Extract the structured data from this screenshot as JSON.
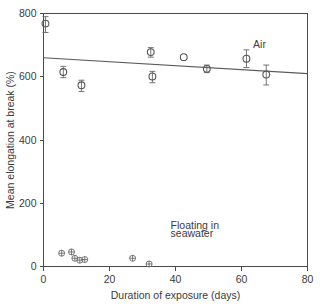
{
  "chart_data": {
    "type": "scatter",
    "title": "",
    "xlabel": "Duration of exposure (days)",
    "ylabel": "Mean elongation at break (%)",
    "xlim": [
      0,
      80
    ],
    "ylim": [
      0,
      800
    ],
    "xticks": [
      0,
      20,
      40,
      60,
      80
    ],
    "yticks": [
      0,
      200,
      400,
      600,
      800
    ],
    "xtick_labels": [
      "0",
      "20",
      "40",
      "60",
      "80"
    ],
    "ytick_labels": [
      "0",
      "200",
      "400",
      "600",
      "800"
    ],
    "grid": false,
    "legend_position": "inline-annotations",
    "annotations": [
      {
        "id": "air",
        "text": "Air",
        "x": 63.5,
        "y": 690
      },
      {
        "id": "seawater-line1",
        "text": "Floating in",
        "x": 38.5,
        "y": 120
      },
      {
        "id": "seawater-line2",
        "text": "seawater",
        "x": 38.5,
        "y": 92
      }
    ],
    "series": [
      {
        "name": "Air",
        "marker": "open-circle",
        "has_error_bars": true,
        "points": [
          {
            "x": 0.6,
            "y": 768,
            "yerr_low": 28,
            "yerr_high": 22
          },
          {
            "x": 6.0,
            "y": 615,
            "yerr_low": 18,
            "yerr_high": 18
          },
          {
            "x": 11.5,
            "y": 573,
            "yerr_low": 20,
            "yerr_high": 16
          },
          {
            "x": 32.5,
            "y": 678,
            "yerr_low": 16,
            "yerr_high": 14
          },
          {
            "x": 33.0,
            "y": 601,
            "yerr_low": 20,
            "yerr_high": 16
          },
          {
            "x": 42.5,
            "y": 662,
            "yerr_low": 0,
            "yerr_high": 0
          },
          {
            "x": 49.5,
            "y": 625,
            "yerr_low": 12,
            "yerr_high": 12
          },
          {
            "x": 61.5,
            "y": 657,
            "yerr_low": 28,
            "yerr_high": 28
          },
          {
            "x": 67.5,
            "y": 607,
            "yerr_low": 33,
            "yerr_high": 30
          }
        ]
      },
      {
        "name": "Floating in seawater",
        "marker": "circle-plus",
        "has_error_bars": false,
        "points": [
          {
            "x": 5.5,
            "y": 42
          },
          {
            "x": 8.5,
            "y": 46
          },
          {
            "x": 9.5,
            "y": 26
          },
          {
            "x": 11.0,
            "y": 20
          },
          {
            "x": 12.5,
            "y": 22
          },
          {
            "x": 27.0,
            "y": 26
          },
          {
            "x": 32.0,
            "y": 8
          }
        ]
      }
    ],
    "fit_line": {
      "name": "Air regression line",
      "x_start": 0,
      "y_start": 660,
      "x_end": 80,
      "y_end": 610
    }
  }
}
